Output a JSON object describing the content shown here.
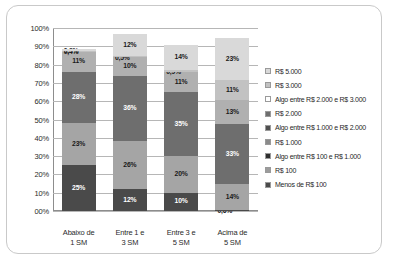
{
  "chart_data": {
    "type": "bar",
    "subtype": "100% stacked bar",
    "title": "",
    "xlabel": "",
    "ylabel": "",
    "ylim": [
      0,
      100
    ],
    "grid": true,
    "legend_position": "right",
    "categories": [
      "Abaixo de 1 SM",
      "Entre 1 e 3 SM",
      "Entre 3 e 5 SM",
      "Acima de 5 SM"
    ],
    "category_lines": [
      [
        "Abaixo de",
        "1 SM"
      ],
      [
        "Entre 1 e",
        "3 SM"
      ],
      [
        "Entre 3 e",
        "5 SM"
      ],
      [
        "Acima de",
        "5 SM"
      ]
    ],
    "ytick_labels": [
      "00%",
      "10%",
      "20%",
      "30%",
      "40%",
      "50%",
      "60%",
      "70%",
      "80%",
      "90%",
      "100%"
    ],
    "ytick_values": [
      0,
      10,
      20,
      30,
      40,
      50,
      60,
      70,
      80,
      90,
      100
    ],
    "series": [
      {
        "name": "R$ 5.000",
        "color": "#d9d9d9",
        "values": [
          0.9,
          12,
          14,
          23
        ],
        "labels": [
          "0,9%",
          "12%",
          "14%",
          "23%"
        ]
      },
      {
        "name": "R$ 3.000",
        "color": "#c2c2c2",
        "values": [
          0.4,
          0.5,
          0.9,
          11
        ],
        "labels": [
          "0,4%",
          "0,5%",
          "0,9%",
          "11%"
        ]
      },
      {
        "name": "Algo entre R$ 2.000 e R$ 3.000",
        "color": "#ffffff",
        "values": [
          0,
          0,
          0,
          0
        ],
        "labels": [
          "",
          "",
          "",
          ""
        ]
      },
      {
        "name": "R$ 2.000",
        "color": "#b0b0b0",
        "values": [
          11,
          10,
          11,
          13
        ],
        "labels": [
          "11%",
          "10%",
          "11%",
          "13%"
        ]
      },
      {
        "name": "Algo entre R$ 1.000 e R$ 2.000",
        "color": "#6e6e6e",
        "values": [
          28,
          36,
          35,
          33
        ],
        "labels": [
          "28%",
          "36%",
          "35%",
          "33%"
        ]
      },
      {
        "name": "R$ 1.000",
        "color": "#a5a5a5",
        "values": [
          23,
          26,
          20,
          14
        ],
        "labels": [
          "23%",
          "26%",
          "20%",
          "14%"
        ]
      },
      {
        "name": "Algo entre R$ 100 e R$ 1.000",
        "color": "#3f3f3f",
        "values": [
          0,
          0,
          0,
          0
        ],
        "labels": [
          "",
          "",
          "",
          ""
        ]
      },
      {
        "name": "R$ 100",
        "color": "#9c9c9c",
        "values": [
          0,
          0,
          0,
          0
        ],
        "labels": [
          "",
          "",
          "",
          ""
        ]
      },
      {
        "name": "Menos de R$ 100",
        "color": "#4a4a4a",
        "values": [
          25,
          12,
          10,
          0.6
        ],
        "labels": [
          "25%",
          "12%",
          "10%",
          "0,6%"
        ]
      }
    ],
    "legend_entries": [
      {
        "label": "R$ 5.000",
        "color": "#d9d9d9"
      },
      {
        "label": "R$ 3.000",
        "color": "#c2c2c2"
      },
      {
        "label": "Algo entre R$ 2.000 e R$ 3.000",
        "color": "#ffffff"
      },
      {
        "label": "R$ 2.000",
        "color": "#6e6e6e"
      },
      {
        "label": "Algo entre R$ 1.000 e R$ 2.000",
        "color": "#4f4f4f"
      },
      {
        "label": "R$ 1.000",
        "color": "#8a8a8a"
      },
      {
        "label": "Algo entre R$ 100 e R$ 1.000",
        "color": "#2e2e2e"
      },
      {
        "label": "R$ 100",
        "color": "#9c9c9c"
      },
      {
        "label": "Menos de R$ 100",
        "color": "#4a4a4a"
      }
    ],
    "stack_order_bottom_to_top": [
      "Menos de R$ 100",
      "R$ 1.000",
      "Algo entre R$ 1.000 e R$ 2.000",
      "R$ 2.000",
      "R$ 3.000",
      "R$ 5.000"
    ],
    "bars": [
      {
        "category": "Abaixo de 1 SM",
        "segments": [
          {
            "name": "Menos de R$ 100",
            "value": 25,
            "label": "25%",
            "color": "#4a4a4a",
            "text_color": "#ffffff"
          },
          {
            "name": "R$ 1.000",
            "value": 23,
            "label": "23%",
            "color": "#a5a5a5",
            "text_color": "#1a1a1a"
          },
          {
            "name": "Algo entre R$ 1.000 e R$ 2.000",
            "value": 28,
            "label": "28%",
            "color": "#6e6e6e",
            "text_color": "#ffffff"
          },
          {
            "name": "R$ 2.000",
            "value": 11,
            "label": "11%",
            "color": "#b0b0b0",
            "text_color": "#1a1a1a"
          },
          {
            "name": "R$ 3.000",
            "value": 0.4,
            "label": "0,4%",
            "color": "#c2c2c2",
            "text_color": "#1a1a1a"
          },
          {
            "name": "R$ 5.000",
            "value": 0.9,
            "label": "0,9%",
            "color": "#d9d9d9",
            "text_color": "#1a1a1a"
          }
        ]
      },
      {
        "category": "Entre 1 e 3 SM",
        "segments": [
          {
            "name": "Menos de R$ 100",
            "value": 12,
            "label": "12%",
            "color": "#4a4a4a",
            "text_color": "#ffffff"
          },
          {
            "name": "R$ 1.000",
            "value": 26,
            "label": "26%",
            "color": "#a5a5a5",
            "text_color": "#1a1a1a"
          },
          {
            "name": "Algo entre R$ 1.000 e R$ 2.000",
            "value": 36,
            "label": "36%",
            "color": "#6e6e6e",
            "text_color": "#ffffff"
          },
          {
            "name": "R$ 2.000",
            "value": 10,
            "label": "10%",
            "color": "#b0b0b0",
            "text_color": "#1a1a1a"
          },
          {
            "name": "R$ 3.000",
            "value": 0.5,
            "label": "0,5%",
            "color": "#c2c2c2",
            "text_color": "#1a1a1a"
          },
          {
            "name": "R$ 5.000",
            "value": 12,
            "label": "12%",
            "color": "#d9d9d9",
            "text_color": "#1a1a1a"
          }
        ]
      },
      {
        "category": "Entre 3 e 5 SM",
        "segments": [
          {
            "name": "Menos de R$ 100",
            "value": 10,
            "label": "10%",
            "color": "#4a4a4a",
            "text_color": "#ffffff"
          },
          {
            "name": "R$ 1.000",
            "value": 20,
            "label": "20%",
            "color": "#a5a5a5",
            "text_color": "#1a1a1a"
          },
          {
            "name": "Algo entre R$ 1.000 e R$ 2.000",
            "value": 35,
            "label": "35%",
            "color": "#6e6e6e",
            "text_color": "#ffffff"
          },
          {
            "name": "R$ 2.000",
            "value": 11,
            "label": "11%",
            "color": "#b0b0b0",
            "text_color": "#1a1a1a"
          },
          {
            "name": "R$ 3.000",
            "value": 0.9,
            "label": "0,9%",
            "color": "#c2c2c2",
            "text_color": "#1a1a1a"
          },
          {
            "name": "R$ 5.000",
            "value": 14,
            "label": "14%",
            "color": "#d9d9d9",
            "text_color": "#1a1a1a"
          }
        ]
      },
      {
        "category": "Acima de 5 SM",
        "segments": [
          {
            "name": "Menos de R$ 100",
            "value": 0.6,
            "label": "0,6%",
            "color": "#4a4a4a",
            "text_color": "#ffffff"
          },
          {
            "name": "R$ 1.000",
            "value": 14,
            "label": "14%",
            "color": "#a5a5a5",
            "text_color": "#1a1a1a"
          },
          {
            "name": "Algo entre R$ 1.000 e R$ 2.000",
            "value": 33,
            "label": "33%",
            "color": "#6e6e6e",
            "text_color": "#ffffff"
          },
          {
            "name": "R$ 2.000",
            "value": 13,
            "label": "13%",
            "color": "#b0b0b0",
            "text_color": "#1a1a1a"
          },
          {
            "name": "R$ 3.000",
            "value": 11,
            "label": "11%",
            "color": "#c2c2c2",
            "text_color": "#1a1a1a"
          },
          {
            "name": "R$ 5.000",
            "value": 23,
            "label": "23%",
            "color": "#d9d9d9",
            "text_color": "#1a1a1a"
          }
        ]
      }
    ]
  }
}
